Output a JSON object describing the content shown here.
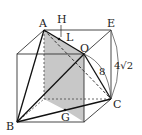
{
  "diagram": {
    "type": "cube-geometry",
    "labels": {
      "A": "A",
      "H": "H",
      "L": "L",
      "E": "E",
      "O": "O",
      "C": "C",
      "B": "B",
      "G": "G",
      "length_OC": "8",
      "length_EC": "4√2"
    },
    "colors": {
      "stroke": "#222222",
      "shade": "#c8c8c8",
      "background": "#ffffff"
    }
  }
}
